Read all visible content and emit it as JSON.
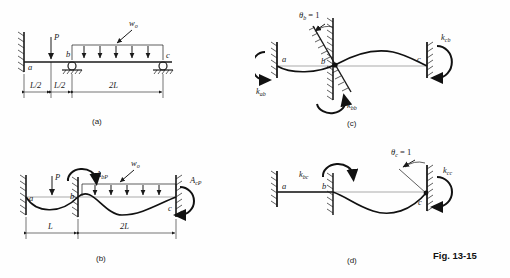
{
  "figure": {
    "number": "Fig. 13-15",
    "panels": [
      {
        "id": "a",
        "caption": "(a)",
        "description": "Propped / continuous beam with point load P and uniform load w0",
        "loads": [
          {
            "name": "point-load",
            "label": "P"
          },
          {
            "name": "distributed-load",
            "label": "w",
            "subscript": "o"
          }
        ],
        "nodes": [
          {
            "label": "a",
            "type": "fixed-wall"
          },
          {
            "label": "b",
            "type": "roller-support"
          },
          {
            "label": "c",
            "type": "roller-support"
          }
        ],
        "dimensions": [
          {
            "label": "L/2"
          },
          {
            "label": "L/2"
          },
          {
            "label": "2L"
          }
        ]
      },
      {
        "id": "b",
        "caption": "(b)",
        "description": "Restrained primary structure with fixed-end moments A_bP and A_cP",
        "loads": [
          {
            "name": "point-load",
            "label": "P"
          },
          {
            "name": "distributed-load",
            "label": "w",
            "subscript": "o"
          }
        ],
        "moments": [
          {
            "name": "moment-a-bp",
            "label": "A",
            "subscript": "bP"
          },
          {
            "name": "moment-a-cp",
            "label": "A",
            "subscript": "cP"
          }
        ],
        "nodes": [
          {
            "label": "a",
            "type": "fixed-wall"
          },
          {
            "label": "b",
            "type": "fixed-wall"
          },
          {
            "label": "c",
            "type": "fixed-wall"
          }
        ],
        "dimensions": [
          {
            "label": "L"
          },
          {
            "label": "2L"
          }
        ]
      },
      {
        "id": "c",
        "caption": "(c)",
        "description": "Unit rotation applied at joint b, stiffness coefficients",
        "unit_rotation": {
          "symbol": "θ",
          "subscript": "b",
          "equals": "= 1"
        },
        "stiffness": [
          {
            "name": "k-ab",
            "label": "k",
            "subscript": "ab"
          },
          {
            "name": "k-bb",
            "label": "k",
            "subscript": "bb"
          },
          {
            "name": "k-cb",
            "label": "k",
            "subscript": "cb"
          }
        ],
        "nodes": [
          {
            "label": "a",
            "type": "fixed-wall"
          },
          {
            "label": "b",
            "type": "rotated-support"
          },
          {
            "label": "c",
            "type": "fixed-wall"
          }
        ]
      },
      {
        "id": "d",
        "caption": "(d)",
        "description": "Unit rotation applied at joint c, stiffness coefficients",
        "unit_rotation": {
          "symbol": "θ",
          "subscript": "c",
          "equals": "= 1"
        },
        "stiffness": [
          {
            "name": "k-bc",
            "label": "k",
            "subscript": "bc"
          },
          {
            "name": "k-cc",
            "label": "k",
            "subscript": "cc"
          }
        ],
        "nodes": [
          {
            "label": "a",
            "type": "fixed-wall"
          },
          {
            "label": "b",
            "type": "fixed-wall"
          },
          {
            "label": "c",
            "type": "fixed-wall"
          }
        ]
      }
    ]
  },
  "colors": {
    "ink": "#1a1a1a",
    "paper": "#fefefe",
    "curve": "#111111",
    "faint": "#555555"
  }
}
